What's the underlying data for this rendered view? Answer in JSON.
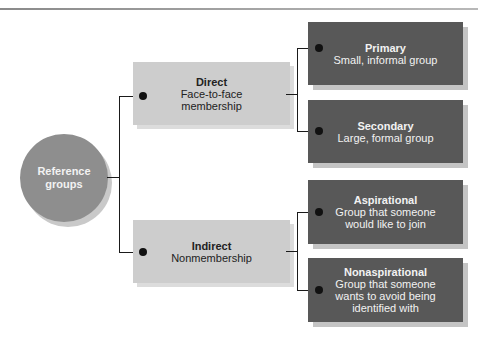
{
  "diagram": {
    "root": {
      "label_line1": "Reference",
      "label_line2": "groups"
    },
    "branches": [
      {
        "title": "Direct",
        "subtitle_line1": "Face-to-face",
        "subtitle_line2": "membership",
        "children": [
          {
            "title": "Primary",
            "lines": [
              "Small, informal group"
            ]
          },
          {
            "title": "Secondary",
            "lines": [
              "Large, formal group"
            ]
          }
        ]
      },
      {
        "title": "Indirect",
        "subtitle_line1": "Nonmembership",
        "children": [
          {
            "title": "Aspirational",
            "lines": [
              "Group that someone",
              "would like to join"
            ]
          },
          {
            "title": "Nonaspirational",
            "lines": [
              "Group that someone",
              "wants to avoid being",
              "identified with"
            ]
          }
        ]
      }
    ],
    "colors": {
      "root_fill": "#8e8e8e",
      "branch_fill": "#cdcdcd",
      "leaf_fill": "#585858",
      "connector": "#1a1a1a"
    }
  }
}
